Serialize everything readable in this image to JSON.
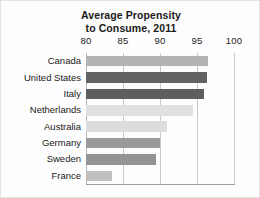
{
  "chart_data": {
    "type": "bar",
    "orientation": "horizontal",
    "title": "Average Propensity to Consume, 2011",
    "title_lines": [
      "Average Propensity",
      "to Consume, 2011"
    ],
    "xlabel": "",
    "ylabel": "",
    "xlim": [
      80,
      100
    ],
    "xticks": [
      80,
      85,
      90,
      95,
      100
    ],
    "xtick_labels": [
      "80",
      "85",
      "90",
      "95",
      "100"
    ],
    "grid": true,
    "grid_axis": "x",
    "legend": false,
    "categories": [
      "Canada",
      "United States",
      "Italy",
      "Netherlands",
      "Australia",
      "Germany",
      "Sweden",
      "France"
    ],
    "values": [
      96.5,
      96.3,
      95.9,
      94.5,
      91.0,
      90.0,
      89.5,
      83.5
    ],
    "bar_colors": [
      "#b3b3b3",
      "#636363",
      "#5e5e5e",
      "#e0e0e0",
      "#dcdcdc",
      "#9a9a9a",
      "#949494",
      "#bfbfbf"
    ],
    "bars": [
      {
        "label": "Canada",
        "value": 96.5,
        "color": "#b3b3b3"
      },
      {
        "label": "United States",
        "value": 96.3,
        "color": "#636363"
      },
      {
        "label": "Italy",
        "value": 95.9,
        "color": "#5e5e5e"
      },
      {
        "label": "Netherlands",
        "value": 94.5,
        "color": "#e0e0e0"
      },
      {
        "label": "Australia",
        "value": 91.0,
        "color": "#dcdcdc"
      },
      {
        "label": "Germany",
        "value": 90.0,
        "color": "#9a9a9a"
      },
      {
        "label": "Sweden",
        "value": 89.5,
        "color": "#949494"
      },
      {
        "label": "France",
        "value": 83.5,
        "color": "#bfbfbf"
      }
    ]
  }
}
